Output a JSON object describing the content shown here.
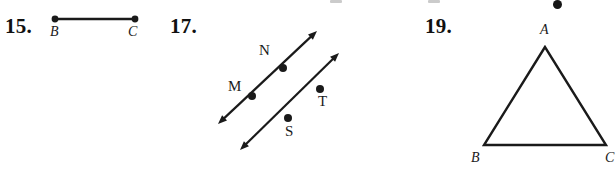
{
  "page": {
    "width": 615,
    "height": 175,
    "background": "#ffffff",
    "ink_color": "#1a1a1a"
  },
  "exercises": [
    {
      "number_label": "15.",
      "number_pos": {
        "x": 5,
        "y": 14
      },
      "figure": {
        "kind": "segment",
        "name": "segment-bc",
        "endpoints": [
          {
            "label": "B",
            "x": 55,
            "y": 19,
            "label_x": 50,
            "label_y": 24
          },
          {
            "label": "C",
            "x": 135,
            "y": 19,
            "label_x": 128,
            "label_y": 24
          }
        ],
        "stroke_width": 2.6,
        "dot_radius": 3.4
      }
    },
    {
      "number_label": "17.",
      "number_pos": {
        "x": 170,
        "y": 14
      },
      "figure": {
        "kind": "parallel-lines",
        "name": "parallel-lines-mn-st",
        "stroke_width": 2.2,
        "dot_radius": 4.0,
        "lines": [
          {
            "name": "line-mn",
            "x1": 218,
            "y1": 124,
            "x2": 317,
            "y2": 31,
            "arrows": "both",
            "points": [
              {
                "label": "M",
                "x": 252,
                "y": 96,
                "label_x": 228,
                "label_y": 78
              },
              {
                "label": "N",
                "x": 283,
                "y": 68,
                "label_x": 259,
                "label_y": 42
              }
            ]
          },
          {
            "name": "line-st",
            "x1": 240,
            "y1": 150,
            "x2": 339,
            "y2": 53,
            "arrows": "both",
            "points": [
              {
                "label": "S",
                "x": 288,
                "y": 118,
                "label_x": 285,
                "label_y": 123
              },
              {
                "label": "T",
                "x": 320,
                "y": 89,
                "label_x": 318,
                "label_y": 93
              }
            ]
          }
        ]
      }
    },
    {
      "number_label": "19.",
      "number_pos": {
        "x": 425,
        "y": 14
      },
      "figure": {
        "kind": "triangle",
        "name": "triangle-abc",
        "stroke_width": 2.4,
        "vertices": [
          {
            "label": "A",
            "x": 545,
            "y": 47,
            "label_x": 540,
            "label_y": 22
          },
          {
            "label": "B",
            "x": 484,
            "y": 145,
            "label_x": 471,
            "label_y": 150
          },
          {
            "label": "C",
            "x": 606,
            "y": 145,
            "label_x": 605,
            "label_y": 150
          }
        ]
      }
    }
  ],
  "cropped_artifacts": {
    "dot": {
      "x": 553,
      "y": 0,
      "size": 9
    },
    "smudges": [
      {
        "x": 330,
        "y": 0,
        "w": 12,
        "h": 3
      },
      {
        "x": 428,
        "y": 0,
        "w": 12,
        "h": 3
      }
    ]
  }
}
